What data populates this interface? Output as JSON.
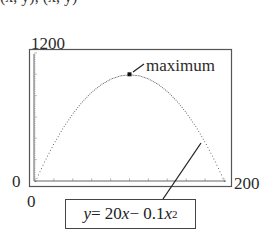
{
  "clipped_header_text": "(x, y), (x, y)",
  "chart_data": {
    "type": "line",
    "title": "",
    "function": "y = 20x - 0.1x^2",
    "x": [
      0,
      10,
      20,
      30,
      40,
      50,
      60,
      70,
      80,
      90,
      100,
      110,
      120,
      130,
      140,
      150,
      160,
      170,
      180,
      190,
      200
    ],
    "series": [
      {
        "name": "y = 20x - 0.1x^2",
        "values": [
          0,
          190,
          360,
          510,
          640,
          750,
          840,
          910,
          960,
          990,
          1000,
          990,
          960,
          910,
          840,
          750,
          640,
          510,
          360,
          190,
          0
        ],
        "style": "dotted"
      }
    ],
    "xlim": [
      0,
      200
    ],
    "ylim": [
      0,
      1200
    ],
    "x_tick_labels": [
      "0",
      "200"
    ],
    "y_tick_labels": [
      "0",
      "1200"
    ],
    "xlabel": "",
    "ylabel": "",
    "grid": false,
    "annotations": [
      {
        "text": "maximum",
        "x": 100,
        "y": 1000,
        "marker": "filled-square"
      },
      {
        "text": "y = 20x − 0.1x²",
        "type": "boxed-label",
        "points_to_x": 170,
        "points_to_y": 510
      }
    ]
  },
  "labels": {
    "y_max": "1200",
    "y_min": "0",
    "x_min": "0",
    "x_max": "200",
    "maximum": "maximum",
    "equation": {
      "y": "y",
      "eq": " = 20",
      "x1": "x",
      "minus": " − 0.1",
      "x2": "x",
      "exp": "2"
    }
  }
}
